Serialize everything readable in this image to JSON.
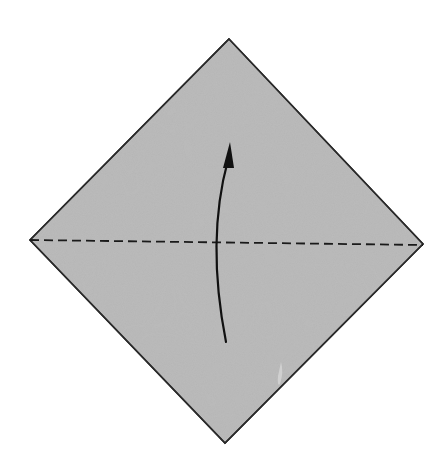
{
  "diagram": {
    "type": "origami-step",
    "paper": {
      "shape": "diamond",
      "fill": "#b5b5b5",
      "stroke": "#2a2a2a",
      "vertices": {
        "top": [
          229,
          39
        ],
        "right": [
          423,
          244
        ],
        "bottom": [
          225,
          443
        ],
        "left": [
          30,
          240
        ]
      }
    },
    "fold_line": {
      "style": "valley-fold-dashed",
      "from": [
        30,
        240
      ],
      "to": [
        423,
        245
      ],
      "color": "#1a1a1a",
      "dash": [
        9,
        5
      ]
    },
    "arrow": {
      "direction": "up",
      "meaning": "fold bottom corner up to top corner",
      "start": [
        226,
        342
      ],
      "control": [
        205,
        240
      ],
      "end": [
        230,
        148
      ],
      "color": "#111111"
    }
  }
}
